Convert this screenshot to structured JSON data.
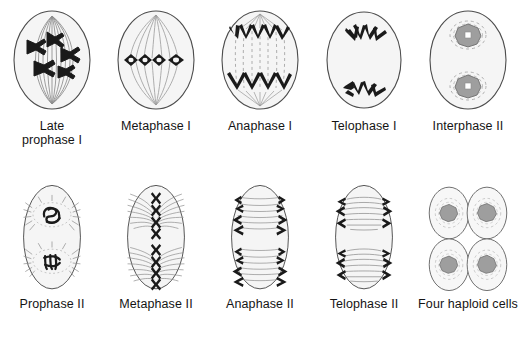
{
  "figure": {
    "rows": 2,
    "columns": 5,
    "style": {
      "cell_outline": "#4d4d4d",
      "cell_fill": "#f5f5f5",
      "chromosome_color": "#1a1a1a",
      "spindle_color": "#8c8c8c",
      "nucleus_fill": "#9e9e9e",
      "nucleolus_fill": "#ffffff",
      "background": "#ffffff",
      "label_color": "#141414"
    },
    "stages": [
      {
        "id": "late-prophase-i",
        "label": "Late\nprophase I",
        "row": 1,
        "column": 1,
        "chromosome_count": 4,
        "chromosome_form": "bivalent-tetrad",
        "spindle": "full-solid",
        "nuclei": 0
      },
      {
        "id": "metaphase-i",
        "label": "Metaphase I",
        "row": 1,
        "column": 2,
        "chromosome_count": 4,
        "chromosome_form": "paired-ring-equator",
        "spindle": "full-solid",
        "nuclei": 0
      },
      {
        "id": "anaphase-i",
        "label": "Anaphase I",
        "row": 1,
        "column": 3,
        "chromosome_count": 8,
        "chromosome_form": "v-shaped-migrating",
        "spindle": "dashed-interzone",
        "nuclei": 0
      },
      {
        "id": "telophase-i",
        "label": "Telophase I",
        "row": 1,
        "column": 4,
        "chromosome_count": 8,
        "chromosome_form": "polar-clusters",
        "spindle": "none",
        "nuclei": 0
      },
      {
        "id": "interphase-ii",
        "label": "Interphase II",
        "row": 1,
        "column": 5,
        "chromosome_count": 0,
        "chromosome_form": "none",
        "spindle": "none",
        "nuclei": 2
      },
      {
        "id": "prophase-ii",
        "label": "Prophase II",
        "row": 2,
        "column": 1,
        "chromosome_count": 2,
        "chromosome_form": "tangled-coil",
        "spindle": "aster-rays",
        "nuclei": 2
      },
      {
        "id": "metaphase-ii",
        "label": "Metaphase II",
        "row": 2,
        "column": 2,
        "chromosome_count": 8,
        "chromosome_form": "x-shaped-equator",
        "spindle": "two-spindles",
        "nuclei": 0
      },
      {
        "id": "anaphase-ii",
        "label": "Anaphase II",
        "row": 2,
        "column": 3,
        "chromosome_count": 12,
        "chromosome_form": "chevron-migrating",
        "spindle": "two-spindles",
        "nuclei": 0
      },
      {
        "id": "telophase-ii",
        "label": "Telophase II",
        "row": 2,
        "column": 4,
        "chromosome_count": 8,
        "chromosome_form": "polar-chevron-clusters",
        "spindle": "two-spindles",
        "nuclei": 0
      },
      {
        "id": "four-haploid-cells",
        "label": "Four haploid cells",
        "row": 2,
        "column": 5,
        "chromosome_count": 0,
        "chromosome_form": "none",
        "spindle": "none",
        "nuclei": 4,
        "daughter_cells": 4
      }
    ]
  }
}
